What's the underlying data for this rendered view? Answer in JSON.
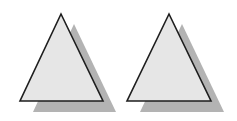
{
  "diagram": {
    "background": "#ffffff",
    "shadow_color": "#b3b3b3",
    "fill_color": "#e6e6e6",
    "stroke_color": "#1e1e1e",
    "shapes": [
      {
        "type": "triangle",
        "label": "",
        "points": "61,14 20,101 103,101",
        "shadow_points": "74,24 33,112 116,112"
      },
      {
        "type": "triangle",
        "label": "",
        "points": "169,14 127,101 211,101",
        "shadow_points": "182,24 140,112 224,112"
      }
    ]
  }
}
